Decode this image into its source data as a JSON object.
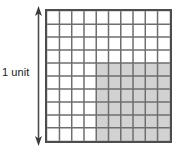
{
  "figure": {
    "label": {
      "text": "1 unit"
    },
    "arrow": {
      "name": "vertical-double-headed-arrow",
      "orientation": "vertical",
      "heads": "both",
      "color": "#4d4d4d"
    },
    "grid": {
      "columns": 10,
      "rows": 10,
      "outer_border_color": "#4d4d4d",
      "inner_line_color": "#6e6e6e",
      "cell_fill_unshaded": "#ffffff",
      "cell_fill_shaded": "#d2d2d2",
      "shaded": {
        "start_column": 5,
        "end_column": 10,
        "start_row": 5,
        "end_row": 10,
        "shaded_columns": 6,
        "shaded_rows": 6,
        "shaded_cells": 36,
        "total_cells": 100,
        "fraction": "36/100"
      }
    }
  }
}
